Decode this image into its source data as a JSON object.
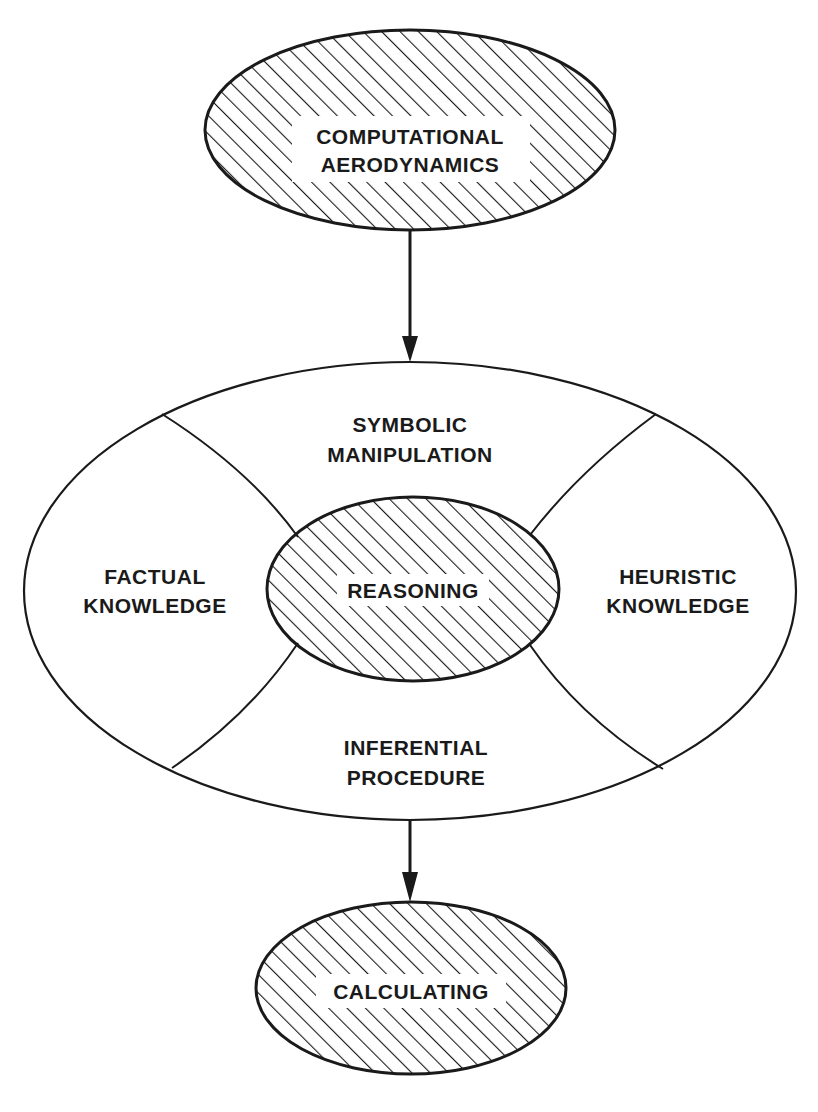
{
  "diagram": {
    "type": "knowledge-system-flow",
    "colors": {
      "stroke": "#1a1a1a",
      "hatch": "#1a1a1a",
      "background": "#ffffff"
    },
    "nodes": {
      "top": {
        "line1": "COMPUTATIONAL",
        "line2": "AERODYNAMICS",
        "style": "hatched-ellipse"
      },
      "ring": {
        "top_segment": {
          "line1": "SYMBOLIC",
          "line2": "MANIPULATION"
        },
        "left_segment": {
          "line1": "FACTUAL",
          "line2": "KNOWLEDGE"
        },
        "right_segment": {
          "line1": "HEURISTIC",
          "line2": "KNOWLEDGE"
        },
        "bottom_segment": {
          "line1": "INFERENTIAL",
          "line2": "PROCEDURE"
        }
      },
      "center": {
        "label": "REASONING",
        "style": "hatched-ellipse"
      },
      "bottom": {
        "label": "CALCULATING",
        "style": "hatched-ellipse"
      }
    },
    "edges": [
      {
        "from": "COMPUTATIONAL AERODYNAMICS",
        "to": "ring",
        "arrow": "down"
      },
      {
        "from": "ring",
        "to": "CALCULATING",
        "arrow": "down"
      }
    ]
  }
}
